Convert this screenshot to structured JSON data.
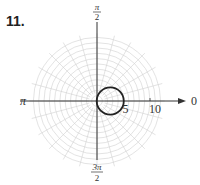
{
  "problem_number": "11.",
  "polar_plot": {
    "angle_labels": {
      "top": {
        "num": "π",
        "den": "2"
      },
      "left": "π",
      "right": "0",
      "bottom": {
        "num": "3π",
        "den": "2"
      }
    },
    "radial_ticks": [
      "5",
      "10"
    ],
    "curve": "r = 5 cos θ (circle of diameter 5 centered at (2.5, 0))",
    "grid": {
      "max_radius": 12,
      "ring_step": 1,
      "spoke_count": 24
    },
    "colors": {
      "grid": "#d0d0d0",
      "axis": "#333333",
      "curve": "#222222"
    }
  }
}
